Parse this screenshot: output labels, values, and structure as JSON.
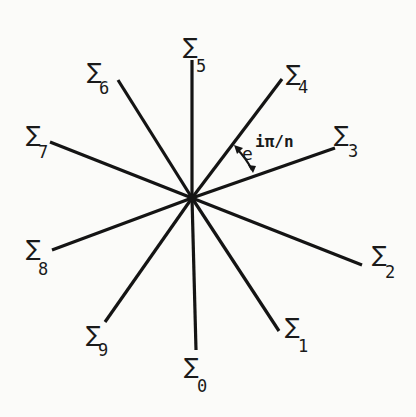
{
  "diagram": {
    "center": {
      "x": 192,
      "y": 198
    },
    "rays": [
      {
        "id": "0",
        "symbol": "∑",
        "subscript": "0",
        "end": [
          196,
          350
        ]
      },
      {
        "id": "1",
        "symbol": "∑",
        "subscript": "1",
        "end": [
          279,
          331
        ]
      },
      {
        "id": "2",
        "symbol": "∑",
        "subscript": "2",
        "end": [
          362,
          265
        ]
      },
      {
        "id": "3",
        "symbol": "∑",
        "subscript": "3",
        "end": [
          335,
          148
        ]
      },
      {
        "id": "4",
        "symbol": "∑",
        "subscript": "4",
        "end": [
          282,
          79
        ]
      },
      {
        "id": "5",
        "symbol": "∑",
        "subscript": "5",
        "end": [
          192,
          60
        ]
      },
      {
        "id": "6",
        "symbol": "∑",
        "subscript": "6",
        "end": [
          118,
          80
        ]
      },
      {
        "id": "7",
        "symbol": "∑",
        "subscript": "7",
        "end": [
          50,
          142
        ]
      },
      {
        "id": "8",
        "symbol": "∑",
        "subscript": "8",
        "end": [
          52,
          250
        ]
      },
      {
        "id": "9",
        "symbol": "∑",
        "subscript": "9",
        "end": [
          105,
          322
        ]
      }
    ],
    "labels": {
      "sigma_symbol": "∑",
      "l0": "0",
      "l1": "1",
      "l2": "2",
      "l3": "3",
      "l4": "4",
      "l5": "5",
      "l6": "6",
      "l7": "7",
      "l8": "8",
      "l9": "9"
    },
    "angle_annotation": {
      "base": "e",
      "exponent": "iπ/n",
      "between_rays": [
        "4",
        "3"
      ]
    }
  }
}
